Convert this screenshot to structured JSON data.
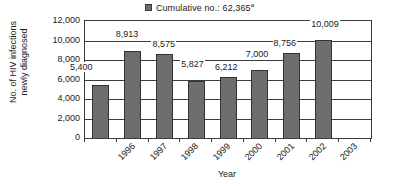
{
  "chart_data": {
    "type": "bar",
    "title": "",
    "subtitle": "",
    "categories": [
      "1996",
      "1997",
      "1998",
      "1999",
      "2000",
      "2001",
      "2002",
      "2003"
    ],
    "values": [
      5400,
      8913,
      8575,
      5827,
      6212,
      7000,
      8756,
      10009
    ],
    "data_labels": [
      "5,400",
      "8,913",
      "8,575",
      "5,827",
      "6,212",
      "7,000",
      "8,756",
      "10,009"
    ],
    "xlabel": "Year",
    "ylabel": "No. of HIV infections newly diagnosed",
    "ylabel_line1": "No. of HIV infections",
    "ylabel_line2": "newly diagnosed",
    "ylim": [
      0,
      12000
    ],
    "ytick_values": [
      0,
      2000,
      4000,
      6000,
      8000,
      10000,
      12000
    ],
    "ytick_labels": [
      "0",
      "2,000",
      "4,000",
      "6,000",
      "8,000",
      "10,000",
      "12,000"
    ],
    "grid": true,
    "grid_axis": "y",
    "legend_position": "top-center",
    "legend": [
      {
        "marker": "square",
        "color": "#6e6e6e",
        "label_prefix": "Cumulative no.: 62,365",
        "label_superscript": "a",
        "label_full": "Cumulative no.: 62,365a"
      }
    ],
    "series": [
      {
        "name": "No. of HIV infections newly diagnosed",
        "color": "#6e6e6e",
        "values": [
          5400,
          8913,
          8575,
          5827,
          6212,
          7000,
          8756,
          10009
        ]
      }
    ],
    "notes": {
      "empty_trailing_category": true,
      "bar_edge_color": "#333333",
      "axis_color": "#3c3c3c",
      "background": "#ffffff"
    }
  }
}
